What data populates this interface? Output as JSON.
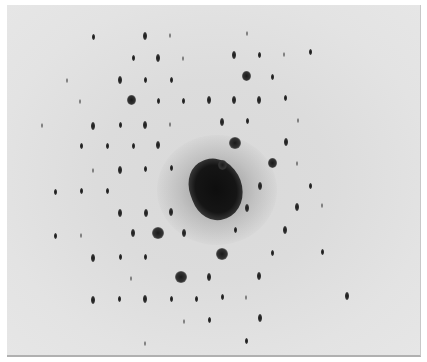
{
  "image": {
    "subject": "electron diffraction spot pattern",
    "background_color": "#dcdcdc",
    "spot_color": "#1a1a1a",
    "central_beam": {
      "x": 209,
      "y": 184
    }
  },
  "spots": [
    {
      "x": 93,
      "y": 37,
      "size": "s"
    },
    {
      "x": 145,
      "y": 36,
      "size": "m"
    },
    {
      "x": 170,
      "y": 35,
      "size": "f"
    },
    {
      "x": 247,
      "y": 33,
      "size": "f"
    },
    {
      "x": 133,
      "y": 58,
      "size": "s"
    },
    {
      "x": 158,
      "y": 58,
      "size": "m"
    },
    {
      "x": 183,
      "y": 58,
      "size": "f"
    },
    {
      "x": 234,
      "y": 55,
      "size": "m"
    },
    {
      "x": 259,
      "y": 55,
      "size": "s"
    },
    {
      "x": 284,
      "y": 54,
      "size": "f"
    },
    {
      "x": 310,
      "y": 52,
      "size": "s"
    },
    {
      "x": 67,
      "y": 80,
      "size": "f"
    },
    {
      "x": 120,
      "y": 80,
      "size": "m"
    },
    {
      "x": 145,
      "y": 80,
      "size": "s"
    },
    {
      "x": 171,
      "y": 80,
      "size": "s"
    },
    {
      "x": 246,
      "y": 76,
      "size": "l"
    },
    {
      "x": 272,
      "y": 77,
      "size": "s"
    },
    {
      "x": 80,
      "y": 101,
      "size": "f"
    },
    {
      "x": 131,
      "y": 100,
      "size": "l"
    },
    {
      "x": 158,
      "y": 101,
      "size": "s"
    },
    {
      "x": 183,
      "y": 101,
      "size": "s"
    },
    {
      "x": 209,
      "y": 100,
      "size": "m"
    },
    {
      "x": 234,
      "y": 100,
      "size": "m"
    },
    {
      "x": 259,
      "y": 100,
      "size": "m"
    },
    {
      "x": 285,
      "y": 98,
      "size": "s"
    },
    {
      "x": 42,
      "y": 125,
      "size": "f"
    },
    {
      "x": 93,
      "y": 126,
      "size": "m"
    },
    {
      "x": 120,
      "y": 125,
      "size": "s"
    },
    {
      "x": 145,
      "y": 125,
      "size": "m"
    },
    {
      "x": 170,
      "y": 124,
      "size": "f"
    },
    {
      "x": 222,
      "y": 122,
      "size": "m"
    },
    {
      "x": 247,
      "y": 121,
      "size": "s"
    },
    {
      "x": 298,
      "y": 120,
      "size": "f"
    },
    {
      "x": 81,
      "y": 146,
      "size": "s"
    },
    {
      "x": 107,
      "y": 146,
      "size": "s"
    },
    {
      "x": 133,
      "y": 146,
      "size": "s"
    },
    {
      "x": 158,
      "y": 145,
      "size": "m"
    },
    {
      "x": 235,
      "y": 143,
      "size": "x"
    },
    {
      "x": 286,
      "y": 142,
      "size": "m"
    },
    {
      "x": 93,
      "y": 170,
      "size": "f"
    },
    {
      "x": 120,
      "y": 170,
      "size": "m"
    },
    {
      "x": 145,
      "y": 169,
      "size": "s"
    },
    {
      "x": 171,
      "y": 168,
      "size": "s"
    },
    {
      "x": 222,
      "y": 165,
      "size": "l"
    },
    {
      "x": 272,
      "y": 163,
      "size": "l"
    },
    {
      "x": 297,
      "y": 163,
      "size": "f"
    },
    {
      "x": 55,
      "y": 192,
      "size": "s"
    },
    {
      "x": 81,
      "y": 191,
      "size": "s"
    },
    {
      "x": 107,
      "y": 191,
      "size": "s"
    },
    {
      "x": 260,
      "y": 186,
      "size": "m"
    },
    {
      "x": 310,
      "y": 186,
      "size": "s"
    },
    {
      "x": 120,
      "y": 213,
      "size": "m"
    },
    {
      "x": 146,
      "y": 213,
      "size": "m"
    },
    {
      "x": 171,
      "y": 212,
      "size": "m"
    },
    {
      "x": 247,
      "y": 208,
      "size": "m"
    },
    {
      "x": 297,
      "y": 207,
      "size": "m"
    },
    {
      "x": 322,
      "y": 205,
      "size": "f"
    },
    {
      "x": 55,
      "y": 236,
      "size": "s"
    },
    {
      "x": 81,
      "y": 235,
      "size": "f"
    },
    {
      "x": 133,
      "y": 233,
      "size": "m"
    },
    {
      "x": 158,
      "y": 233,
      "size": "x"
    },
    {
      "x": 184,
      "y": 233,
      "size": "m"
    },
    {
      "x": 235,
      "y": 230,
      "size": "s"
    },
    {
      "x": 285,
      "y": 230,
      "size": "m"
    },
    {
      "x": 93,
      "y": 258,
      "size": "m"
    },
    {
      "x": 120,
      "y": 257,
      "size": "s"
    },
    {
      "x": 145,
      "y": 257,
      "size": "s"
    },
    {
      "x": 222,
      "y": 254,
      "size": "x"
    },
    {
      "x": 272,
      "y": 253,
      "size": "s"
    },
    {
      "x": 322,
      "y": 252,
      "size": "s"
    },
    {
      "x": 131,
      "y": 278,
      "size": "f"
    },
    {
      "x": 181,
      "y": 277,
      "size": "x"
    },
    {
      "x": 209,
      "y": 277,
      "size": "m"
    },
    {
      "x": 259,
      "y": 276,
      "size": "m"
    },
    {
      "x": 93,
      "y": 300,
      "size": "m"
    },
    {
      "x": 119,
      "y": 299,
      "size": "s"
    },
    {
      "x": 145,
      "y": 299,
      "size": "m"
    },
    {
      "x": 171,
      "y": 299,
      "size": "s"
    },
    {
      "x": 196,
      "y": 299,
      "size": "s"
    },
    {
      "x": 222,
      "y": 297,
      "size": "s"
    },
    {
      "x": 246,
      "y": 297,
      "size": "f"
    },
    {
      "x": 347,
      "y": 296,
      "size": "m"
    },
    {
      "x": 184,
      "y": 321,
      "size": "f"
    },
    {
      "x": 209,
      "y": 320,
      "size": "s"
    },
    {
      "x": 260,
      "y": 318,
      "size": "m"
    },
    {
      "x": 145,
      "y": 343,
      "size": "f"
    },
    {
      "x": 246,
      "y": 341,
      "size": "s"
    }
  ]
}
